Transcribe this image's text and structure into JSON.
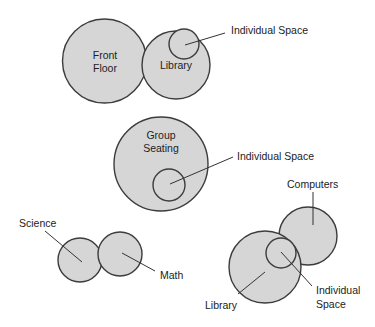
{
  "diagram": {
    "colors": {
      "circle_fill": "#d6d6d6",
      "circle_stroke": "#3c3c3c",
      "text": "#222222",
      "background": "#ffffff"
    },
    "groups": [
      {
        "id": "group-1",
        "circles": [
          {
            "name": "Front Floor",
            "lines": [
              "Front",
              "Floor"
            ]
          },
          {
            "name": "Library",
            "lines": [
              "Library"
            ]
          },
          {
            "name": "Individual Space",
            "lines": []
          }
        ],
        "callouts": [
          {
            "text": "Individual Space",
            "points_to": "Individual Space"
          }
        ]
      },
      {
        "id": "group-2",
        "circles": [
          {
            "name": "Group Seating",
            "lines": [
              "Group",
              "Seating"
            ]
          },
          {
            "name": "Individual Space",
            "lines": []
          }
        ],
        "callouts": [
          {
            "text": "Individual Space",
            "points_to": "Individual Space"
          }
        ]
      },
      {
        "id": "group-3",
        "circles": [
          {
            "name": "Science",
            "lines": []
          },
          {
            "name": "Math",
            "lines": []
          }
        ],
        "callouts": [
          {
            "text": "Science",
            "points_to": "Science"
          },
          {
            "text": "Math",
            "points_to": "Math"
          }
        ]
      },
      {
        "id": "group-4",
        "circles": [
          {
            "name": "Computers",
            "lines": []
          },
          {
            "name": "Library",
            "lines": []
          },
          {
            "name": "Individual Space",
            "lines": []
          }
        ],
        "callouts": [
          {
            "text": "Computers",
            "points_to": "Computers"
          },
          {
            "lines": [
              "Individual",
              "Space"
            ],
            "points_to": "Individual Space"
          },
          {
            "text": "Library",
            "points_to": "Library"
          }
        ]
      }
    ]
  }
}
